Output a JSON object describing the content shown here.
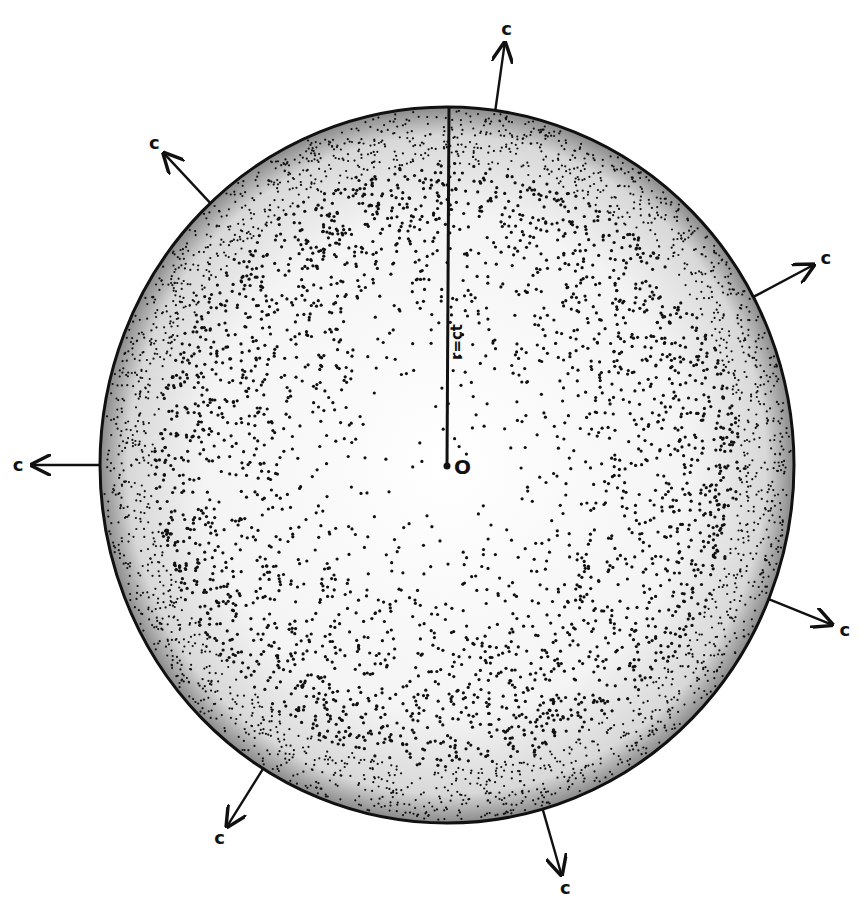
{
  "diagram": {
    "center_label": "O",
    "radius_label": "r=ct",
    "arrow_label": "c",
    "ink_color": "#111111",
    "background": "#ffffff",
    "sphere": {
      "cx": 447,
      "cy": 465,
      "rx": 347,
      "ry": 358
    },
    "arrows": [
      {
        "angle_deg": -82,
        "label": "c"
      },
      {
        "angle_deg": -133,
        "label": "c"
      },
      {
        "angle_deg": -28,
        "label": "c"
      },
      {
        "angle_deg": 180,
        "label": "c"
      },
      {
        "angle_deg": 22,
        "label": "c"
      },
      {
        "angle_deg": 122,
        "label": "c"
      },
      {
        "angle_deg": 74,
        "label": "c"
      }
    ]
  }
}
